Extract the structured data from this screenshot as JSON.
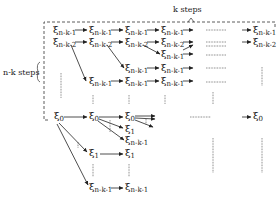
{
  "diagram": {
    "top_label": "k steps",
    "left_label": "n-k steps",
    "symbol": "ξ",
    "nodes": [
      {
        "id": "r1c1",
        "sub": "n-k-1",
        "x": 53,
        "y": 29
      },
      {
        "id": "r1c2",
        "sub": "n-k-1",
        "x": 89,
        "y": 29
      },
      {
        "id": "r1c3",
        "sub": "n-k-1",
        "x": 125,
        "y": 29
      },
      {
        "id": "r1c4",
        "sub": "n-k-1",
        "x": 161,
        "y": 29
      },
      {
        "id": "r1c6",
        "sub": "n-k-1",
        "x": 253,
        "y": 29
      },
      {
        "id": "r2c1",
        "sub": "n-k-2",
        "x": 53,
        "y": 41
      },
      {
        "id": "r2c2",
        "sub": "n-k-2",
        "x": 89,
        "y": 41
      },
      {
        "id": "r2c3",
        "sub": "n-k-2",
        "x": 125,
        "y": 41
      },
      {
        "id": "r2c4",
        "sub": "n-k-2",
        "x": 161,
        "y": 41
      },
      {
        "id": "r2c6",
        "sub": "n-k-2",
        "x": 253,
        "y": 41
      },
      {
        "id": "r3c4",
        "sub": "n-k-1",
        "x": 161,
        "y": 53
      },
      {
        "id": "r4c3",
        "sub": "n-k-1",
        "x": 125,
        "y": 67
      },
      {
        "id": "r4c4",
        "sub": "n-k-1",
        "x": 161,
        "y": 67
      },
      {
        "id": "r5c2",
        "sub": "n-k-1",
        "x": 89,
        "y": 80
      },
      {
        "id": "r5c3",
        "sub": "n-k-1",
        "x": 125,
        "y": 80
      },
      {
        "id": "r5c4",
        "sub": "n-k-1",
        "x": 161,
        "y": 80
      },
      {
        "id": "z1",
        "sub": "0",
        "x": 54,
        "y": 115
      },
      {
        "id": "z2",
        "sub": "0",
        "x": 89,
        "y": 115
      },
      {
        "id": "z3",
        "sub": "0",
        "x": 125,
        "y": 115
      },
      {
        "id": "z6",
        "sub": "0",
        "x": 253,
        "y": 115
      },
      {
        "id": "o3a",
        "sub": "1",
        "x": 125,
        "y": 128
      },
      {
        "id": "n3a",
        "sub": "n-k-1",
        "x": 125,
        "y": 139
      },
      {
        "id": "o2",
        "sub": "1",
        "x": 89,
        "y": 152
      },
      {
        "id": "o3b",
        "sub": "1",
        "x": 125,
        "y": 152
      },
      {
        "id": "n2",
        "sub": "n-k-1",
        "x": 89,
        "y": 186
      },
      {
        "id": "n3b",
        "sub": "n-k-1",
        "x": 125,
        "y": 186
      }
    ]
  }
}
